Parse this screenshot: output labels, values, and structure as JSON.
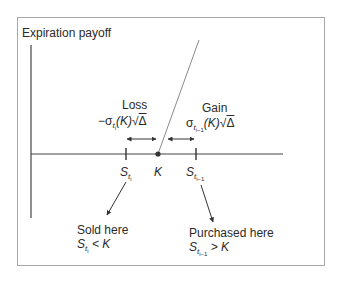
{
  "diagram": {
    "title": "Expiration payoff",
    "labels": {
      "loss": "Loss",
      "gain": "Gain",
      "loss_formula": {
        "prefix": "−σ",
        "sub": "t",
        "subsub": "i",
        "middle": "(K)√",
        "radicand": "Δ"
      },
      "gain_formula": {
        "prefix": "σ",
        "sub": "t",
        "subsub": "i−1",
        "middle": "(K)√",
        "radicand": "Δ"
      },
      "s_ti": {
        "base": "S",
        "sub": "t",
        "subsub": "i"
      },
      "k": "K",
      "s_ti1": {
        "base": "S",
        "sub": "t",
        "subsub": "i−1"
      },
      "sold_here": "Sold here",
      "sold_cond": {
        "base": "S",
        "sub": "t",
        "subsub": "i",
        "rest": " < K"
      },
      "purchased_here": "Purchased here",
      "purchased_cond": {
        "base": "S",
        "sub": "t",
        "subsub": "i−1",
        "rest": " > K"
      }
    },
    "colors": {
      "axis": "#444444",
      "payoff_line": "#8a8a8a",
      "frame": "#a8a8a8",
      "text": "#2a2a2a"
    }
  }
}
